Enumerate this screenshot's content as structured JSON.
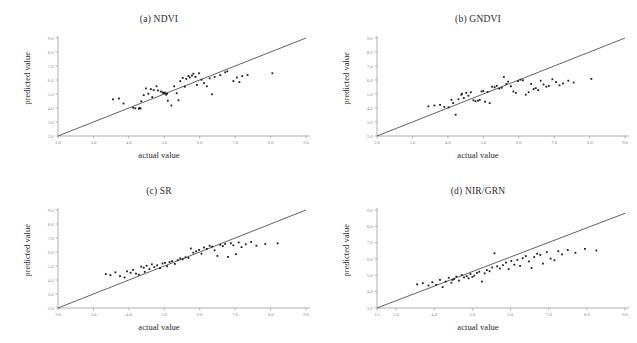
{
  "figure": {
    "background": "#ffffff",
    "point_color": "#1e1e1e",
    "line_color": "#3a3a3a",
    "axis_color": "#9a9a9a"
  },
  "panels": [
    {
      "key": "a",
      "title": "(a) NDVI",
      "xlabel": "actual value",
      "ylabel": "predicted value",
      "xticks": [
        "2.0",
        "3.0",
        "4.0",
        "5.0",
        "6.0",
        "7.0",
        "8.0",
        "9.0"
      ],
      "yticks": [
        "2.0",
        "3.0",
        "4.0",
        "5.0",
        "6.0",
        "7.0",
        "8.0",
        "9.0"
      ]
    },
    {
      "key": "b",
      "title": "(b) GNDVI",
      "xlabel": "actual value",
      "ylabel": "predicted value",
      "xticks": [
        "2.0",
        "3.0",
        "4.0",
        "5.0",
        "6.0",
        "7.0",
        "8.0",
        "9.0"
      ],
      "yticks": [
        "2.0",
        "3.0",
        "4.0",
        "5.0",
        "6.0",
        "7.0",
        "8.0",
        "9.0"
      ]
    },
    {
      "key": "c",
      "title": "(c) SR",
      "xlabel": "actual value",
      "ylabel": "predicted value",
      "xticks": [
        "2.0",
        "3.0",
        "4.0",
        "5.0",
        "6.0",
        "7.0",
        "8.0",
        "9.0"
      ],
      "yticks": [
        "2.0",
        "3.0",
        "4.0",
        "5.0",
        "6.0",
        "7.0",
        "8.0",
        "9.0"
      ]
    },
    {
      "key": "d",
      "title": "(d) NIR/GRN",
      "xlabel": "actual value",
      "ylabel": "predicted value",
      "xticks": [
        "2.5",
        "3.0",
        "4.0",
        "5.0",
        "6.0",
        "7.0",
        "8.0",
        "9.0"
      ],
      "yticks": [
        "3.0",
        "4.0",
        "5.0",
        "6.0",
        "7.0",
        "8.0",
        "9.0"
      ]
    }
  ],
  "chart_data": [
    {
      "type": "scatter",
      "title": "(a) NDVI",
      "xlabel": "actual value",
      "ylabel": "predicted value",
      "xlim": [
        2.0,
        9.0
      ],
      "ylim": [
        2.0,
        9.0
      ],
      "grid": false,
      "legend": "none",
      "reference_line": {
        "type": "1:1 identity",
        "from": [
          2.0,
          2.0
        ],
        "to": [
          9.0,
          9.0
        ]
      },
      "points": [
        [
          3.55,
          4.62
        ],
        [
          3.72,
          4.68
        ],
        [
          3.85,
          4.32
        ],
        [
          4.12,
          4.02
        ],
        [
          4.18,
          3.98
        ],
        [
          4.28,
          3.95
        ],
        [
          4.3,
          4.0
        ],
        [
          4.33,
          3.97
        ],
        [
          4.35,
          4.48
        ],
        [
          4.42,
          4.92
        ],
        [
          4.48,
          5.4
        ],
        [
          4.55,
          5.02
        ],
        [
          4.62,
          5.35
        ],
        [
          4.66,
          4.78
        ],
        [
          4.7,
          5.28
        ],
        [
          4.78,
          5.55
        ],
        [
          4.82,
          5.25
        ],
        [
          4.9,
          5.18
        ],
        [
          4.95,
          5.12
        ],
        [
          4.97,
          5.08
        ],
        [
          5.0,
          5.05
        ],
        [
          5.02,
          5.1
        ],
        [
          5.05,
          4.95
        ],
        [
          5.08,
          5.02
        ],
        [
          5.1,
          4.52
        ],
        [
          5.2,
          4.18
        ],
        [
          5.28,
          5.55
        ],
        [
          5.35,
          5.05
        ],
        [
          5.4,
          4.55
        ],
        [
          5.45,
          5.92
        ],
        [
          5.52,
          6.15
        ],
        [
          5.58,
          5.52
        ],
        [
          5.62,
          6.08
        ],
        [
          5.68,
          6.28
        ],
        [
          5.72,
          6.18
        ],
        [
          5.78,
          6.32
        ],
        [
          5.82,
          6.45
        ],
        [
          5.88,
          6.22
        ],
        [
          5.92,
          5.65
        ],
        [
          5.98,
          6.48
        ],
        [
          6.05,
          6.02
        ],
        [
          6.12,
          5.78
        ],
        [
          6.2,
          5.55
        ],
        [
          6.28,
          6.12
        ],
        [
          6.35,
          4.98
        ],
        [
          6.42,
          6.22
        ],
        [
          6.58,
          6.35
        ],
        [
          6.72,
          6.55
        ],
        [
          6.78,
          6.62
        ],
        [
          6.95,
          5.92
        ],
        [
          7.05,
          6.18
        ],
        [
          7.12,
          5.85
        ],
        [
          7.2,
          6.28
        ],
        [
          7.35,
          6.35
        ],
        [
          8.05,
          6.48
        ]
      ]
    },
    {
      "type": "scatter",
      "title": "(b) GNDVI",
      "xlabel": "actual value",
      "ylabel": "predicted value",
      "xlim": [
        2.0,
        9.0
      ],
      "ylim": [
        2.0,
        9.0
      ],
      "grid": false,
      "legend": "none",
      "reference_line": {
        "type": "1:1 identity",
        "from": [
          2.0,
          2.0
        ],
        "to": [
          9.0,
          9.0
        ]
      },
      "points": [
        [
          3.45,
          4.12
        ],
        [
          3.62,
          4.18
        ],
        [
          3.78,
          4.22
        ],
        [
          3.9,
          4.08
        ],
        [
          4.02,
          4.05
        ],
        [
          4.1,
          4.58
        ],
        [
          4.15,
          4.35
        ],
        [
          4.22,
          3.52
        ],
        [
          4.3,
          4.62
        ],
        [
          4.38,
          4.95
        ],
        [
          4.45,
          4.72
        ],
        [
          4.52,
          5.08
        ],
        [
          4.58,
          4.88
        ],
        [
          4.65,
          5.12
        ],
        [
          4.72,
          4.55
        ],
        [
          4.78,
          4.48
        ],
        [
          4.85,
          4.52
        ],
        [
          4.9,
          4.58
        ],
        [
          4.95,
          5.18
        ],
        [
          5.0,
          5.22
        ],
        [
          5.05,
          4.45
        ],
        [
          5.12,
          5.15
        ],
        [
          5.18,
          4.35
        ],
        [
          5.25,
          5.52
        ],
        [
          5.32,
          5.48
        ],
        [
          5.38,
          5.58
        ],
        [
          5.45,
          5.38
        ],
        [
          5.52,
          5.45
        ],
        [
          5.58,
          6.22
        ],
        [
          5.65,
          5.72
        ],
        [
          5.7,
          5.88
        ],
        [
          5.78,
          5.55
        ],
        [
          5.85,
          5.18
        ],
        [
          5.92,
          5.08
        ],
        [
          5.98,
          5.92
        ],
        [
          6.05,
          6.02
        ],
        [
          6.12,
          5.98
        ],
        [
          6.2,
          4.95
        ],
        [
          6.28,
          5.12
        ],
        [
          6.35,
          5.72
        ],
        [
          6.42,
          5.35
        ],
        [
          6.48,
          5.42
        ],
        [
          6.55,
          5.28
        ],
        [
          6.62,
          5.95
        ],
        [
          6.7,
          5.68
        ],
        [
          6.78,
          5.52
        ],
        [
          6.85,
          5.58
        ],
        [
          6.95,
          6.05
        ],
        [
          7.05,
          5.85
        ],
        [
          7.15,
          5.62
        ],
        [
          7.25,
          5.75
        ],
        [
          7.4,
          5.95
        ],
        [
          7.55,
          5.82
        ],
        [
          8.05,
          6.08
        ],
        [
          4.4,
          5.02
        ]
      ]
    },
    {
      "type": "scatter",
      "title": "(c) SR",
      "xlabel": "actual value",
      "ylabel": "predicted value",
      "xlim": [
        2.0,
        9.0
      ],
      "ylim": [
        2.0,
        9.0
      ],
      "grid": false,
      "legend": "none",
      "reference_line": {
        "type": "1:1 identity",
        "from": [
          2.0,
          2.0
        ],
        "to": [
          9.0,
          9.0
        ]
      },
      "points": [
        [
          3.35,
          4.42
        ],
        [
          3.48,
          4.35
        ],
        [
          3.62,
          4.55
        ],
        [
          3.75,
          4.28
        ],
        [
          3.88,
          4.18
        ],
        [
          3.95,
          4.62
        ],
        [
          4.05,
          4.52
        ],
        [
          4.12,
          4.72
        ],
        [
          4.2,
          4.45
        ],
        [
          4.28,
          4.38
        ],
        [
          4.35,
          4.95
        ],
        [
          4.42,
          4.88
        ],
        [
          4.5,
          5.02
        ],
        [
          4.58,
          4.78
        ],
        [
          4.65,
          5.12
        ],
        [
          4.72,
          4.92
        ],
        [
          4.8,
          5.05
        ],
        [
          4.88,
          4.85
        ],
        [
          4.95,
          5.18
        ],
        [
          5.02,
          5.22
        ],
        [
          5.08,
          4.98
        ],
        [
          5.15,
          5.28
        ],
        [
          5.22,
          5.35
        ],
        [
          5.3,
          5.15
        ],
        [
          5.38,
          5.42
        ],
        [
          5.45,
          5.55
        ],
        [
          5.52,
          5.48
        ],
        [
          5.6,
          5.62
        ],
        [
          5.68,
          5.58
        ],
        [
          5.75,
          6.25
        ],
        [
          5.82,
          5.95
        ],
        [
          5.9,
          6.05
        ],
        [
          5.98,
          6.15
        ],
        [
          6.05,
          5.88
        ],
        [
          6.12,
          6.32
        ],
        [
          6.2,
          6.22
        ],
        [
          6.28,
          6.45
        ],
        [
          6.35,
          6.38
        ],
        [
          6.42,
          6.12
        ],
        [
          6.5,
          5.72
        ],
        [
          6.58,
          6.52
        ],
        [
          6.65,
          6.42
        ],
        [
          6.72,
          6.58
        ],
        [
          6.8,
          5.65
        ],
        [
          6.88,
          6.62
        ],
        [
          6.95,
          6.48
        ],
        [
          7.02,
          5.85
        ],
        [
          7.1,
          6.68
        ],
        [
          7.18,
          6.35
        ],
        [
          7.3,
          6.55
        ],
        [
          7.45,
          6.72
        ],
        [
          7.6,
          6.45
        ],
        [
          7.85,
          6.58
        ],
        [
          8.2,
          6.62
        ],
        [
          4.45,
          4.58
        ]
      ]
    },
    {
      "type": "scatter",
      "title": "(d) NIR/GRN",
      "xlabel": "actual value",
      "ylabel": "predicted value",
      "xlim": [
        2.5,
        9.0
      ],
      "ylim": [
        3.0,
        9.0
      ],
      "grid": false,
      "legend": "none",
      "reference_line": {
        "type": "1:1 identity",
        "from": [
          2.5,
          3.0
        ],
        "to": [
          9.0,
          8.8
        ]
      },
      "points": [
        [
          3.55,
          4.45
        ],
        [
          3.7,
          4.52
        ],
        [
          3.85,
          4.38
        ],
        [
          3.95,
          4.58
        ],
        [
          4.05,
          4.42
        ],
        [
          4.15,
          4.72
        ],
        [
          4.22,
          4.28
        ],
        [
          4.3,
          4.62
        ],
        [
          4.38,
          4.85
        ],
        [
          4.45,
          4.55
        ],
        [
          4.52,
          4.78
        ],
        [
          4.58,
          4.92
        ],
        [
          4.65,
          4.68
        ],
        [
          4.72,
          5.02
        ],
        [
          4.78,
          4.88
        ],
        [
          4.85,
          4.95
        ],
        [
          4.9,
          4.82
        ],
        [
          4.95,
          5.08
        ],
        [
          5.0,
          4.9
        ],
        [
          5.05,
          4.98
        ],
        [
          5.12,
          5.15
        ],
        [
          5.18,
          5.22
        ],
        [
          5.25,
          4.62
        ],
        [
          5.32,
          5.12
        ],
        [
          5.38,
          5.32
        ],
        [
          5.45,
          5.25
        ],
        [
          5.52,
          5.48
        ],
        [
          5.58,
          6.35
        ],
        [
          5.65,
          5.55
        ],
        [
          5.72,
          5.42
        ],
        [
          5.8,
          5.62
        ],
        [
          5.88,
          5.78
        ],
        [
          5.95,
          5.38
        ],
        [
          6.02,
          5.88
        ],
        [
          6.1,
          5.65
        ],
        [
          6.18,
          5.95
        ],
        [
          6.25,
          5.58
        ],
        [
          6.32,
          6.05
        ],
        [
          6.4,
          6.18
        ],
        [
          6.48,
          5.85
        ],
        [
          6.55,
          5.45
        ],
        [
          6.62,
          6.12
        ],
        [
          6.7,
          6.32
        ],
        [
          6.78,
          6.25
        ],
        [
          6.85,
          5.72
        ],
        [
          6.95,
          6.42
        ],
        [
          7.05,
          6.02
        ],
        [
          7.15,
          5.92
        ],
        [
          7.25,
          6.48
        ],
        [
          7.35,
          6.28
        ],
        [
          7.5,
          6.55
        ],
        [
          7.7,
          6.38
        ],
        [
          7.95,
          6.62
        ],
        [
          8.25,
          6.52
        ],
        [
          4.48,
          4.72
        ]
      ]
    }
  ]
}
